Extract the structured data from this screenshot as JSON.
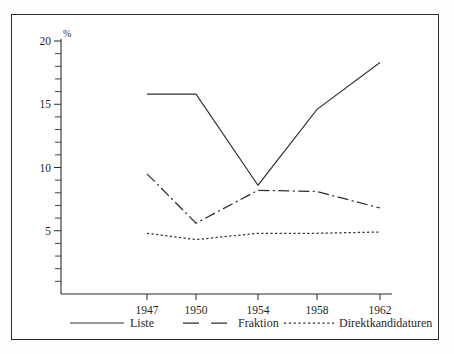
{
  "chart_data": {
    "type": "line",
    "title": "",
    "subtitle": "",
    "xlabel": "",
    "ylabel": "%",
    "yunit": "%",
    "x": [
      "1947",
      "1950",
      "1954",
      "1958",
      "1962"
    ],
    "categories": [
      "1947",
      "1950",
      "1954",
      "1958",
      "1962"
    ],
    "xtick_labels": [
      "1947",
      "1950",
      "1954",
      "1958",
      "1962"
    ],
    "ytick_labels": [
      "5",
      "10",
      "15",
      "20"
    ],
    "ytick_values": [
      5,
      10,
      15,
      20
    ],
    "ylim": [
      0,
      20
    ],
    "y_minor_step": 1,
    "grid": false,
    "legend_position": "bottom",
    "series": [
      {
        "name": "Liste",
        "style": "solid",
        "color": "#2e2e2e",
        "values": [
          15.8,
          15.8,
          8.6,
          14.6,
          18.3
        ]
      },
      {
        "name": "Fraktion",
        "style": "dash-dot",
        "color": "#2e2e2e",
        "values": [
          9.5,
          5.6,
          8.2,
          8.1,
          6.8
        ]
      },
      {
        "name": "Direktkandidaturen",
        "style": "dotted",
        "color": "#2e2e2e",
        "values": [
          4.8,
          4.3,
          4.8,
          4.8,
          4.9
        ]
      }
    ]
  },
  "legend": {
    "items": [
      {
        "label": "Liste",
        "style": "solid"
      },
      {
        "label": "Fraktion",
        "style": "dash-dot"
      },
      {
        "label": "Direktkandidaturen",
        "style": "dotted"
      }
    ]
  },
  "axis": {
    "y_unit_label": "%",
    "y_labels": [
      "20",
      "15",
      "10",
      "5"
    ],
    "x_labels": [
      "1947",
      "1950",
      "1954",
      "1958",
      "1962"
    ]
  }
}
